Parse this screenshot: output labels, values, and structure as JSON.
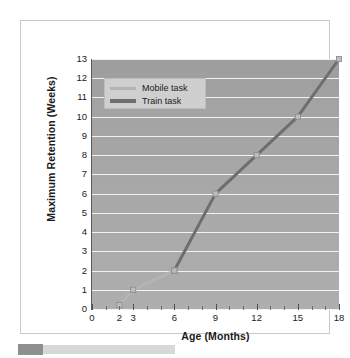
{
  "figure": {
    "caption_strip": {
      "swatch_color": "#8f8f8f",
      "bar_color": "#d8d8d8"
    }
  },
  "chart_data": {
    "type": "line",
    "title": "",
    "xlabel": "Age (Months)",
    "ylabel": "Maximum Retention (Weeks)",
    "xlim": [
      0,
      18
    ],
    "ylim": [
      0,
      13
    ],
    "grid": true,
    "legend_position": "top-left",
    "x_tick_labels": [
      "0",
      "2",
      "3",
      "6",
      "9",
      "12",
      "15",
      "18"
    ],
    "x_tick_values": [
      0,
      2,
      3,
      6,
      9,
      12,
      15,
      18
    ],
    "x_major_ticks": [
      0,
      3,
      6,
      9,
      12,
      15,
      18
    ],
    "x_minor_ticks": [
      1,
      2,
      4,
      5,
      7,
      8,
      10,
      11,
      13,
      14,
      16,
      17
    ],
    "y_tick_labels": [
      "0",
      "1",
      "2",
      "3",
      "4",
      "5",
      "6",
      "7",
      "8",
      "9",
      "10",
      "11",
      "12",
      "13"
    ],
    "y_tick_values": [
      0,
      1,
      2,
      3,
      4,
      5,
      6,
      7,
      8,
      9,
      10,
      11,
      12,
      13
    ],
    "series": [
      {
        "name": "Mobile task",
        "color": "#b4b4b4",
        "x": [
          2,
          3,
          6
        ],
        "values": [
          0.2,
          1,
          2
        ]
      },
      {
        "name": "Train task",
        "color": "#6e6e6e",
        "x": [
          6,
          9,
          12,
          15,
          18
        ],
        "values": [
          2,
          6,
          8,
          10,
          13
        ]
      }
    ],
    "legend": [
      {
        "label": "Mobile task",
        "color": "#b4b4b4"
      },
      {
        "label": "Train task",
        "color": "#6e6e6e"
      }
    ],
    "plot_background": "#a6a6a6",
    "gridline_color": "#f2f2f2"
  }
}
